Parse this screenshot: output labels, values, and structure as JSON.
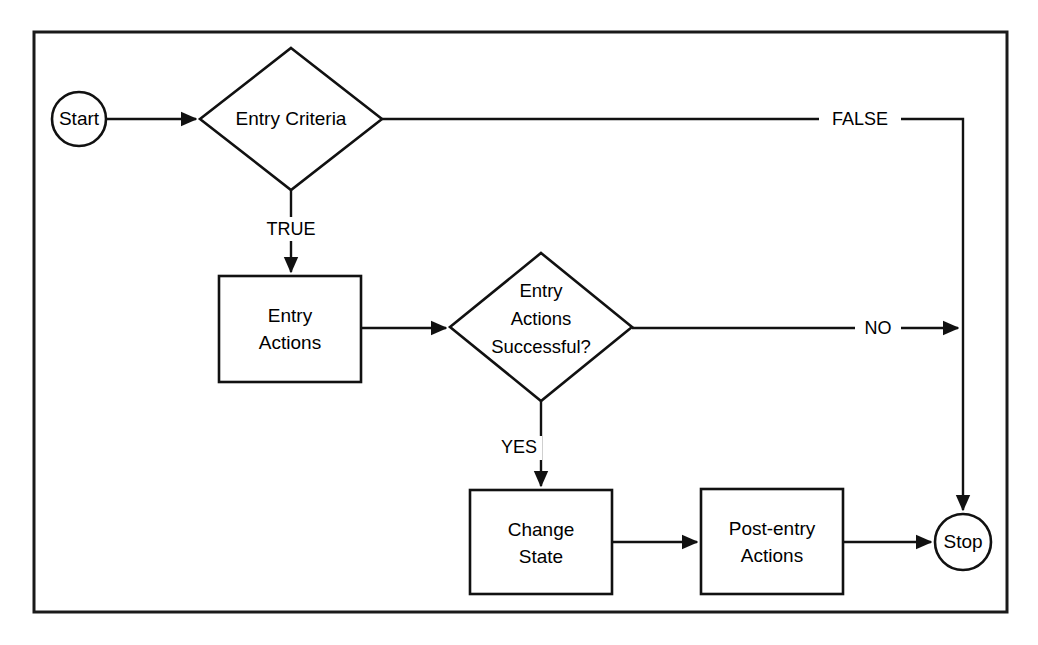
{
  "diagram": {
    "type": "flowchart",
    "background_color": "#ffffff",
    "stroke_color": "#111111",
    "frame": {
      "x": 34,
      "y": 32,
      "width": 973,
      "height": 580
    },
    "nodes": [
      {
        "id": "start",
        "shape": "circle",
        "label": "Start",
        "cx": 79,
        "cy": 119,
        "r": 27
      },
      {
        "id": "entry-criteria",
        "shape": "diamond",
        "label": "Entry Criteria",
        "lines": [
          "Entry Criteria"
        ],
        "cx": 291,
        "cy": 119,
        "half_width": 91,
        "half_height": 71
      },
      {
        "id": "entry-actions",
        "shape": "rectangle",
        "label": "Entry Actions",
        "lines": [
          "Entry",
          "Actions"
        ],
        "x": 219,
        "y": 276,
        "width": 142,
        "height": 106
      },
      {
        "id": "entry-actions-successful",
        "shape": "diamond",
        "label": "Entry Actions Successful?",
        "lines": [
          "Entry",
          "Actions",
          "Successful?"
        ],
        "cx": 541,
        "cy": 327,
        "half_width": 91,
        "half_height": 74
      },
      {
        "id": "change-state",
        "shape": "rectangle",
        "label": "Change State",
        "lines": [
          "Change",
          "State"
        ],
        "x": 470,
        "y": 490,
        "width": 142,
        "height": 104
      },
      {
        "id": "post-entry-actions",
        "shape": "rectangle",
        "label": "Post-entry Actions",
        "lines": [
          "Post-entry",
          "Actions"
        ],
        "x": 701,
        "y": 489,
        "width": 142,
        "height": 105
      },
      {
        "id": "stop",
        "shape": "circle",
        "label": "Stop",
        "cx": 963,
        "cy": 542,
        "r": 28
      }
    ],
    "edges": [
      {
        "id": "start-to-entry-criteria",
        "from": "start",
        "to": "entry-criteria",
        "label": ""
      },
      {
        "id": "entry-criteria-true",
        "from": "entry-criteria",
        "to": "entry-actions",
        "label": "TRUE"
      },
      {
        "id": "entry-criteria-false",
        "from": "entry-criteria",
        "to": "stop",
        "label": "FALSE"
      },
      {
        "id": "entry-actions-to-decision",
        "from": "entry-actions",
        "to": "entry-actions-successful",
        "label": ""
      },
      {
        "id": "decision-no",
        "from": "entry-actions-successful",
        "to": "stop",
        "label": "NO"
      },
      {
        "id": "decision-yes",
        "from": "entry-actions-successful",
        "to": "change-state",
        "label": "YES"
      },
      {
        "id": "change-state-to-post-entry",
        "from": "change-state",
        "to": "post-entry-actions",
        "label": ""
      },
      {
        "id": "post-entry-to-stop",
        "from": "post-entry-actions",
        "to": "stop",
        "label": ""
      }
    ]
  }
}
